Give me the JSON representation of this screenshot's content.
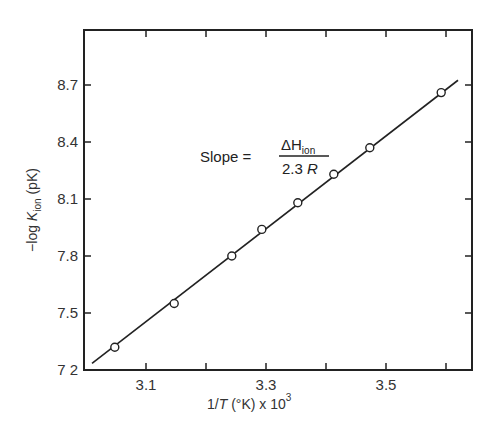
{
  "chart_data": {
    "type": "scatter",
    "title": "",
    "xlabel": "1/T (°K) x 10^3",
    "ylabel": "−log K_ion (pK)",
    "xlim": [
      2.995,
      3.645
    ],
    "ylim": [
      7.2,
      8.9
    ],
    "grid": false,
    "legend": null,
    "x_ticks": [
      3.1,
      3.2,
      3.3,
      3.4,
      3.5,
      3.6
    ],
    "x_tick_labels": [
      "3.1",
      "",
      "3.3",
      "",
      "3.5",
      ""
    ],
    "y_ticks": [
      7.2,
      7.5,
      7.8,
      8.1,
      8.4,
      8.7
    ],
    "y_tick_labels": [
      "7 2",
      "7.5",
      "7.8",
      "8.1",
      "8.4",
      "8.7"
    ],
    "series": [
      {
        "name": "measured",
        "marker": "open-circle",
        "x": [
          3.048,
          3.147,
          3.243,
          3.293,
          3.353,
          3.413,
          3.473,
          3.592
        ],
        "y": [
          7.32,
          7.55,
          7.8,
          7.94,
          8.08,
          8.23,
          8.37,
          8.66
        ]
      },
      {
        "name": "linear fit",
        "style": "line",
        "x": [
          3.01,
          3.62
        ],
        "y": [
          7.235,
          8.725
        ]
      }
    ],
    "annotations": [
      {
        "text": "Slope = ΔH_ion / 2.3 R",
        "x": 3.19,
        "y": 8.37
      }
    ]
  },
  "labels": {
    "ylabel_prefix": "−log ",
    "ylabel_K": "K",
    "ylabel_sub": "ion",
    "ylabel_suffix": " (pK)",
    "xlabel_prefix": "1/",
    "xlabel_T": "T",
    "xlabel_suffix": " (°K) x 10",
    "xlabel_exp": "3",
    "slope_text": "Slope =",
    "frac_num_delta": "ΔH",
    "frac_num_sub": "ion",
    "frac_den": "2.3 ",
    "frac_den_R": "R"
  },
  "colors": {
    "ink": "#222222",
    "background": "#ffffff"
  }
}
